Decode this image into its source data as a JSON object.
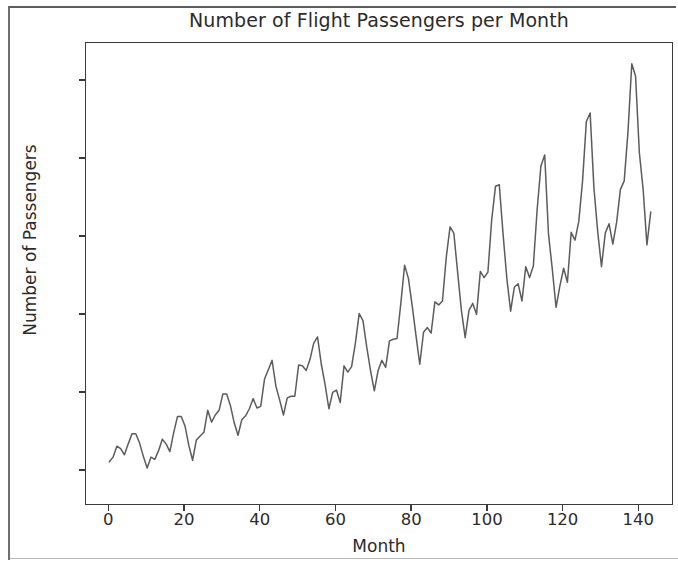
{
  "figure": {
    "background_color": "#ffffff",
    "frame_color": "#6f6f6f",
    "axes_color": "#3a3a3a",
    "text_color": "#2b2b2b"
  },
  "chart_data": {
    "type": "line",
    "title": "Number of Flight Passengers per Month",
    "xlabel": "Month",
    "ylabel": "Number of Passengers",
    "line_color": "#5c5c5c",
    "line_width": 1.5,
    "grid": false,
    "legend": null,
    "xlim": [
      -6.15,
      149.15
    ],
    "ylim": [
      55.4,
      648.6
    ],
    "xticks": [
      0,
      20,
      40,
      60,
      80,
      100,
      120,
      140
    ],
    "xticklabels": [
      "0",
      "20",
      "40",
      "60",
      "80",
      "100",
      "120",
      "140"
    ],
    "yticks": [
      100,
      200,
      300,
      400,
      500,
      600
    ],
    "yticklabels": [
      "100",
      "200",
      "300",
      "400",
      "500",
      "600"
    ],
    "x": [
      0,
      1,
      2,
      3,
      4,
      5,
      6,
      7,
      8,
      9,
      10,
      11,
      12,
      13,
      14,
      15,
      16,
      17,
      18,
      19,
      20,
      21,
      22,
      23,
      24,
      25,
      26,
      27,
      28,
      29,
      30,
      31,
      32,
      33,
      34,
      35,
      36,
      37,
      38,
      39,
      40,
      41,
      42,
      43,
      44,
      45,
      46,
      47,
      48,
      49,
      50,
      51,
      52,
      53,
      54,
      55,
      56,
      57,
      58,
      59,
      60,
      61,
      62,
      63,
      64,
      65,
      66,
      67,
      68,
      69,
      70,
      71,
      72,
      73,
      74,
      75,
      76,
      77,
      78,
      79,
      80,
      81,
      82,
      83,
      84,
      85,
      86,
      87,
      88,
      89,
      90,
      91,
      92,
      93,
      94,
      95,
      96,
      97,
      98,
      99,
      100,
      101,
      102,
      103,
      104,
      105,
      106,
      107,
      108,
      109,
      110,
      111,
      112,
      113,
      114,
      115,
      116,
      117,
      118,
      119,
      120,
      121,
      122,
      123,
      124,
      125,
      126,
      127,
      128,
      129,
      130,
      131,
      132,
      133,
      134,
      135,
      136,
      137,
      138,
      139,
      140,
      141,
      142,
      143
    ],
    "values": [
      112,
      118,
      132,
      129,
      121,
      135,
      148,
      148,
      136,
      119,
      104,
      118,
      115,
      126,
      141,
      135,
      125,
      149,
      170,
      170,
      158,
      133,
      114,
      140,
      145,
      150,
      178,
      163,
      172,
      178,
      199,
      199,
      184,
      162,
      146,
      166,
      171,
      180,
      193,
      181,
      183,
      218,
      230,
      242,
      209,
      191,
      172,
      194,
      196,
      196,
      236,
      235,
      229,
      243,
      264,
      272,
      237,
      211,
      180,
      201,
      204,
      188,
      235,
      227,
      234,
      264,
      302,
      293,
      259,
      229,
      203,
      229,
      242,
      233,
      267,
      269,
      270,
      315,
      364,
      347,
      312,
      274,
      237,
      278,
      284,
      277,
      317,
      313,
      318,
      374,
      413,
      405,
      355,
      306,
      271,
      306,
      315,
      301,
      356,
      348,
      355,
      422,
      465,
      467,
      404,
      347,
      305,
      336,
      340,
      318,
      362,
      348,
      363,
      435,
      491,
      505,
      404,
      359,
      310,
      337,
      360,
      342,
      406,
      396,
      420,
      472,
      548,
      559,
      463,
      407,
      362,
      405,
      417,
      391,
      419,
      461,
      472,
      535,
      622,
      606,
      508,
      461,
      390,
      432
    ],
    "series_name": "Passengers",
    "n_points": 144,
    "data_min": 104,
    "data_max": 622
  }
}
